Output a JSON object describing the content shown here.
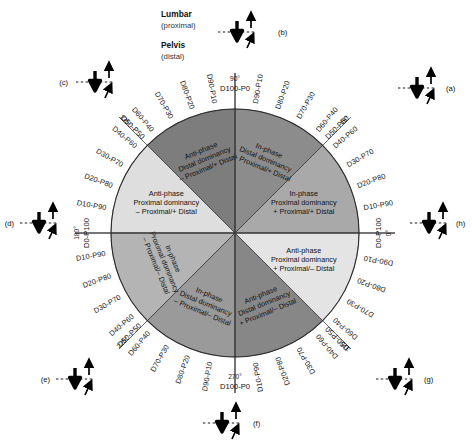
{
  "figure": {
    "center": {
      "x": 235,
      "y": 233
    },
    "radius": 124
  },
  "anatomy_key": {
    "proximal_name": "Lumbar",
    "proximal_sub": "(proximal)",
    "distal_name": "Pelvis",
    "distal_sub": "(distal)"
  },
  "axes": [
    {
      "id": "right",
      "degrees": "0°",
      "code": "D0-P100"
    },
    {
      "id": "top",
      "degrees": "90°",
      "code": "D100-P0"
    },
    {
      "id": "left",
      "degrees": "180°",
      "code": "D0-P100"
    },
    {
      "id": "bottom",
      "degrees": "270°",
      "code": "D100-P0"
    }
  ],
  "diagonals": [
    {
      "id": "ne",
      "degrees": "45°",
      "code": "D50-P50"
    },
    {
      "id": "nw",
      "degrees": "135°",
      "code": "D50-P50"
    },
    {
      "id": "sw",
      "degrees": "225°",
      "code": "D50-P50"
    },
    {
      "id": "se",
      "degrees": "315°",
      "code": "D50-P50"
    }
  ],
  "ticks": {
    "quadrant_ne": [
      "D10-P90",
      "D20-P80",
      "D30-P70",
      "D40-P60",
      "D60-P40",
      "D70-P30",
      "D80-P20",
      "D90-P10"
    ],
    "quadrant_nw": [
      "D90-P10",
      "D80-P20",
      "D70-P30",
      "D60-P40",
      "D40-P60",
      "D30-P70",
      "D20-P80",
      "D10-P90"
    ],
    "quadrant_sw": [
      "D10-P90",
      "D20-P80",
      "D30-P70",
      "D40-P60",
      "D60-P40",
      "D70-P30",
      "D80-P20",
      "D90-P10"
    ],
    "quadrant_se": [
      "D10-P90",
      "D20-P80",
      "D30-P70",
      "D40-P60",
      "D60-P40",
      "D70-P30",
      "D80-P20",
      "D90-P10"
    ]
  },
  "octants": [
    {
      "id": "oct-0-45",
      "phase": "In-phase",
      "dominancy": "Proximal dominancy",
      "signs": "+ Proximal/+ Distal",
      "fill": "#a9a9a9",
      "rotated": false
    },
    {
      "id": "oct-45-90",
      "phase": "In-phase",
      "dominancy": "Distal dominancy",
      "signs": "+ Proximal/+ Distal",
      "fill": "#8c8c8c",
      "rotated": true
    },
    {
      "id": "oct-90-135",
      "phase": "Anti-phase",
      "dominancy": "Distal dominancy",
      "signs": "– Proximal/+ Distal",
      "fill": "#7d7d7d",
      "rotated": true
    },
    {
      "id": "oct-135-180",
      "phase": "Anti-phase",
      "dominancy": "Proximal dominancy",
      "signs": "– Proximal/+ Distal",
      "fill": "#dedede",
      "rotated": false
    },
    {
      "id": "oct-180-225",
      "phase": "In-phase",
      "dominancy": "Proximal dominancy",
      "signs": "– Proximal/– Distal",
      "fill": "#b4b4b4",
      "rotated": true
    },
    {
      "id": "oct-225-270",
      "phase": "In-phase",
      "dominancy": "Distal dominancy",
      "signs": "– Proximal/– Distal",
      "fill": "#9a9a9a",
      "rotated": true
    },
    {
      "id": "oct-270-315",
      "phase": "Anti-phase",
      "dominancy": "Distal dominancy",
      "signs": "+ Proximal/– Distal",
      "fill": "#878787",
      "rotated": true
    },
    {
      "id": "oct-315-360",
      "phase": "Anti-phase",
      "dominancy": "Proximal dominancy",
      "signs": "+ Proximal/– Distal",
      "fill": "#e4e4e4",
      "rotated": false
    }
  ],
  "pictograms": [
    {
      "id": "a",
      "label": "(a)",
      "x": 420,
      "y": 88,
      "label_dx": 26,
      "label_dy": 3,
      "line": "left"
    },
    {
      "id": "b",
      "label": "(b)",
      "x": 240,
      "y": 32,
      "label_dx": 38,
      "label_dy": 3,
      "line": "left"
    },
    {
      "id": "c",
      "label": "(c)",
      "x": 98,
      "y": 82,
      "label_dx": -30,
      "label_dy": 3,
      "line": "right"
    },
    {
      "id": "d",
      "label": "(d)",
      "x": 42,
      "y": 223,
      "label_dx": -28,
      "label_dy": 3,
      "line": "right"
    },
    {
      "id": "e",
      "label": "(e)",
      "x": 78,
      "y": 379,
      "label_dx": -28,
      "label_dy": 3,
      "line": "right"
    },
    {
      "id": "f",
      "label": "(f)",
      "x": 225,
      "y": 423,
      "label_dx": 28,
      "label_dy": 3,
      "line": "left"
    },
    {
      "id": "g",
      "label": "(g)",
      "x": 398,
      "y": 379,
      "label_dx": 26,
      "label_dy": 3,
      "line": "left"
    },
    {
      "id": "h",
      "label": "(h)",
      "x": 432,
      "y": 223,
      "label_dx": 24,
      "label_dy": 3,
      "line": "left"
    }
  ],
  "colors": {
    "outline": "#000000",
    "text": "#111111",
    "light_octant": "#dedede",
    "mid_octant": "#a9a9a9",
    "dark_octant": "#808080"
  }
}
